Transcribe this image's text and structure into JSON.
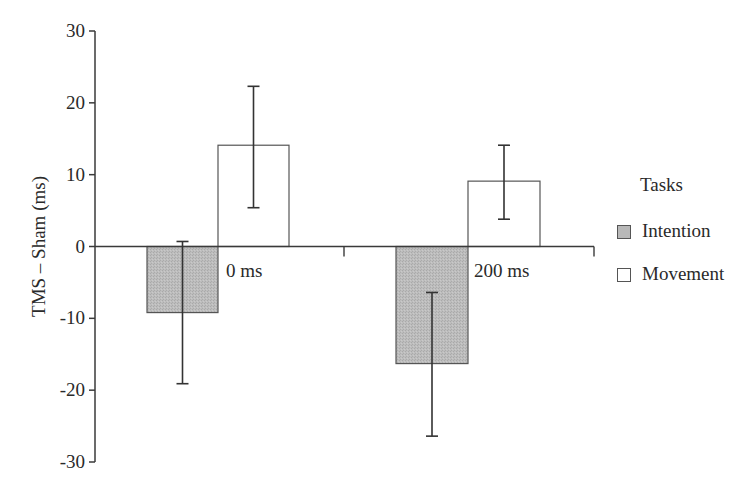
{
  "chart_data": {
    "type": "bar",
    "title": "",
    "xlabel": "",
    "ylabel": "TMS – Sham (ms)",
    "ylim": [
      -30,
      30
    ],
    "yticks": [
      30,
      20,
      10,
      0,
      -10,
      -20,
      -30
    ],
    "ytick_labels": [
      "30",
      "20",
      "10",
      "0",
      "-10",
      "-20",
      "-30"
    ],
    "categories": [
      "0 ms",
      "200 ms"
    ],
    "grid": false,
    "legend_position": "right",
    "legend_title": "Tasks",
    "series": [
      {
        "name": "Intention",
        "color": "#b8b8b8",
        "values": [
          -9.2,
          -16.3
        ],
        "error_upper": [
          0.7,
          -6.4
        ],
        "error_lower": [
          -19.1,
          -26.4
        ]
      },
      {
        "name": "Movement",
        "color": "#ffffff",
        "values": [
          14.1,
          9.1
        ],
        "error_upper": [
          22.3,
          14.1
        ],
        "error_lower": [
          5.4,
          3.8
        ]
      }
    ],
    "annotations": [
      "0 ms",
      "200 ms"
    ]
  },
  "legend": {
    "title": "Tasks",
    "items": [
      {
        "label": "Intention",
        "color": "#b8b8b8"
      },
      {
        "label": "Movement",
        "color": "#ffffff"
      }
    ]
  },
  "colors": {
    "axis": "#3a3a3a",
    "intention_fill": "#b8b8b8",
    "movement_fill": "#ffffff",
    "text": "#2a2a2a"
  }
}
